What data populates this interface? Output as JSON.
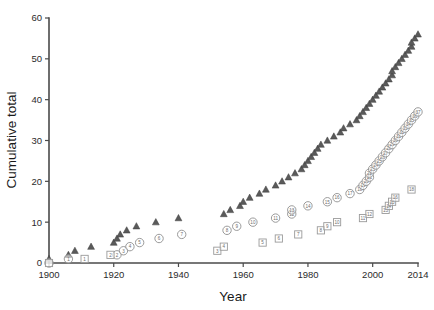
{
  "chart_data": {
    "type": "scatter",
    "title": "",
    "xlabel": "Year",
    "ylabel": "Cumulative total",
    "xlim": [
      1900,
      2014
    ],
    "ylim": [
      0,
      60
    ],
    "grid": false,
    "legend": "none",
    "xticks": [
      "1900",
      "1920",
      "1940",
      "1960",
      "1980",
      "2000",
      "2014"
    ],
    "xtick_values": [
      1900,
      1920,
      1940,
      1960,
      1980,
      2000,
      2014
    ],
    "yticks": [
      "0",
      "10",
      "20",
      "30",
      "40",
      "50",
      "60"
    ],
    "ytick_values": [
      0,
      10,
      20,
      30,
      40,
      50,
      60
    ],
    "series": [
      {
        "name": "triangle-series",
        "marker": "triangle",
        "color": "#5a5a5a",
        "labelled": false,
        "points": [
          {
            "x": 1900,
            "y": 1
          },
          {
            "x": 1906,
            "y": 2
          },
          {
            "x": 1908,
            "y": 3
          },
          {
            "x": 1913,
            "y": 4
          },
          {
            "x": 1920,
            "y": 5
          },
          {
            "x": 1921,
            "y": 6
          },
          {
            "x": 1922,
            "y": 7
          },
          {
            "x": 1924,
            "y": 8
          },
          {
            "x": 1927,
            "y": 9
          },
          {
            "x": 1933,
            "y": 10
          },
          {
            "x": 1940,
            "y": 11
          },
          {
            "x": 1954,
            "y": 12
          },
          {
            "x": 1956,
            "y": 13
          },
          {
            "x": 1959,
            "y": 14
          },
          {
            "x": 1960,
            "y": 15
          },
          {
            "x": 1962,
            "y": 16
          },
          {
            "x": 1965,
            "y": 17
          },
          {
            "x": 1967,
            "y": 18
          },
          {
            "x": 1970,
            "y": 19
          },
          {
            "x": 1972,
            "y": 20
          },
          {
            "x": 1974,
            "y": 21
          },
          {
            "x": 1976,
            "y": 22
          },
          {
            "x": 1978,
            "y": 23
          },
          {
            "x": 1979,
            "y": 24
          },
          {
            "x": 1980,
            "y": 25
          },
          {
            "x": 1981,
            "y": 26
          },
          {
            "x": 1982,
            "y": 27
          },
          {
            "x": 1983,
            "y": 28
          },
          {
            "x": 1984,
            "y": 29
          },
          {
            "x": 1986,
            "y": 30
          },
          {
            "x": 1988,
            "y": 31
          },
          {
            "x": 1990,
            "y": 32
          },
          {
            "x": 1991,
            "y": 33
          },
          {
            "x": 1993,
            "y": 34
          },
          {
            "x": 1995,
            "y": 35
          },
          {
            "x": 1996,
            "y": 36
          },
          {
            "x": 1997,
            "y": 37
          },
          {
            "x": 1998,
            "y": 38
          },
          {
            "x": 1999,
            "y": 39
          },
          {
            "x": 2000,
            "y": 40
          },
          {
            "x": 2001,
            "y": 41
          },
          {
            "x": 2002,
            "y": 42
          },
          {
            "x": 2003,
            "y": 43
          },
          {
            "x": 2004,
            "y": 44
          },
          {
            "x": 2005,
            "y": 45
          },
          {
            "x": 2006,
            "y": 46
          },
          {
            "x": 2006,
            "y": 47
          },
          {
            "x": 2007,
            "y": 48
          },
          {
            "x": 2008,
            "y": 49
          },
          {
            "x": 2009,
            "y": 50
          },
          {
            "x": 2010,
            "y": 51
          },
          {
            "x": 2011,
            "y": 52
          },
          {
            "x": 2012,
            "y": 53
          },
          {
            "x": 2012,
            "y": 54
          },
          {
            "x": 2013,
            "y": 55
          },
          {
            "x": 2014,
            "y": 56
          }
        ]
      },
      {
        "name": "circle-series",
        "marker": "circle",
        "color": "#8e8e8e",
        "labelled": true,
        "points": [
          {
            "x": 1900,
            "y": 0,
            "label": ""
          },
          {
            "x": 1906,
            "y": 1,
            "label": "1"
          },
          {
            "x": 1921,
            "y": 2,
            "label": "2"
          },
          {
            "x": 1923,
            "y": 3,
            "label": "3"
          },
          {
            "x": 1925,
            "y": 4,
            "label": "4"
          },
          {
            "x": 1928,
            "y": 5,
            "label": "5"
          },
          {
            "x": 1934,
            "y": 6,
            "label": "6"
          },
          {
            "x": 1941,
            "y": 7,
            "label": "7"
          },
          {
            "x": 1955,
            "y": 8,
            "label": "8"
          },
          {
            "x": 1958,
            "y": 9,
            "label": "9"
          },
          {
            "x": 1963,
            "y": 10,
            "label": "10"
          },
          {
            "x": 1970,
            "y": 11,
            "label": "11"
          },
          {
            "x": 1975,
            "y": 12,
            "label": "12"
          },
          {
            "x": 1975,
            "y": 13,
            "label": "13"
          },
          {
            "x": 1980,
            "y": 14,
            "label": "14"
          },
          {
            "x": 1986,
            "y": 15,
            "label": "15"
          },
          {
            "x": 1989,
            "y": 16,
            "label": "16"
          },
          {
            "x": 1993,
            "y": 17,
            "label": "17"
          },
          {
            "x": 1996,
            "y": 18,
            "label": "18"
          },
          {
            "x": 1997,
            "y": 19,
            "label": "19"
          },
          {
            "x": 1998,
            "y": 20,
            "label": "20"
          },
          {
            "x": 1999,
            "y": 21,
            "label": "21"
          },
          {
            "x": 1999,
            "y": 22,
            "label": "22"
          },
          {
            "x": 2000,
            "y": 23,
            "label": "23"
          },
          {
            "x": 2001,
            "y": 24,
            "label": "24"
          },
          {
            "x": 2002,
            "y": 25,
            "label": "25"
          },
          {
            "x": 2003,
            "y": 26,
            "label": "26"
          },
          {
            "x": 2004,
            "y": 27,
            "label": "27"
          },
          {
            "x": 2005,
            "y": 28,
            "label": "28"
          },
          {
            "x": 2006,
            "y": 29,
            "label": "29"
          },
          {
            "x": 2007,
            "y": 30,
            "label": "30"
          },
          {
            "x": 2008,
            "y": 31,
            "label": "31"
          },
          {
            "x": 2009,
            "y": 32,
            "label": "32"
          },
          {
            "x": 2010,
            "y": 33,
            "label": "33"
          },
          {
            "x": 2011,
            "y": 34,
            "label": "34"
          },
          {
            "x": 2012,
            "y": 35,
            "label": "35"
          },
          {
            "x": 2013,
            "y": 36,
            "label": "36"
          },
          {
            "x": 2014,
            "y": 37,
            "label": "37"
          }
        ]
      },
      {
        "name": "square-series",
        "marker": "square",
        "color": "#9a9a9a",
        "labelled": true,
        "points": [
          {
            "x": 1900,
            "y": 0,
            "label": ""
          },
          {
            "x": 1911,
            "y": 1,
            "label": "1"
          },
          {
            "x": 1919,
            "y": 2,
            "label": "2"
          },
          {
            "x": 1952,
            "y": 3,
            "label": "3"
          },
          {
            "x": 1954,
            "y": 4,
            "label": "4"
          },
          {
            "x": 1966,
            "y": 5,
            "label": "5"
          },
          {
            "x": 1971,
            "y": 6,
            "label": "6"
          },
          {
            "x": 1977,
            "y": 7,
            "label": "7"
          },
          {
            "x": 1984,
            "y": 8,
            "label": "8"
          },
          {
            "x": 1986,
            "y": 9,
            "label": "9"
          },
          {
            "x": 1989,
            "y": 10,
            "label": "10"
          },
          {
            "x": 1997,
            "y": 11,
            "label": "11"
          },
          {
            "x": 1999,
            "y": 12,
            "label": "12"
          },
          {
            "x": 2004,
            "y": 13,
            "label": "13"
          },
          {
            "x": 2005,
            "y": 14,
            "label": "14"
          },
          {
            "x": 2006,
            "y": 15,
            "label": "15"
          },
          {
            "x": 2007,
            "y": 16,
            "label": "16"
          },
          {
            "x": 2012,
            "y": 18,
            "label": "18"
          }
        ]
      }
    ]
  },
  "axes": {
    "y_title": "Cumulative total",
    "x_title": "Year"
  }
}
